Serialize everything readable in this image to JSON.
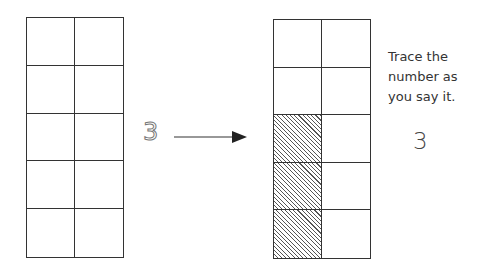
{
  "left_frame": {
    "columns": 2,
    "rows": 5,
    "shaded_cells": []
  },
  "trace_number": "3",
  "arrow": {
    "direction": "right"
  },
  "right_frame": {
    "columns": 2,
    "rows": 5,
    "shaded_cells": [
      [
        2,
        0
      ],
      [
        3,
        0
      ],
      [
        4,
        0
      ]
    ],
    "shaded_count": 3
  },
  "instruction": {
    "lines": [
      "Trace the",
      "number as",
      "you say it."
    ]
  },
  "example_number": "3"
}
